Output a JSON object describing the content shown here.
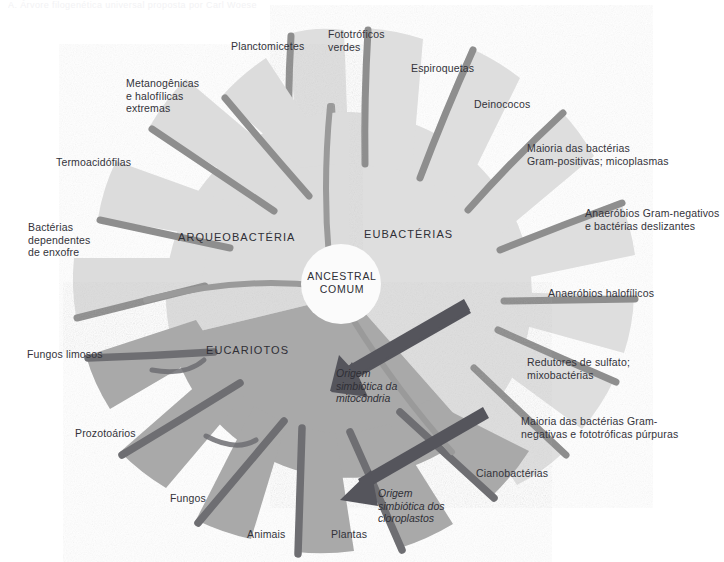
{
  "figure": {
    "top_caption": "A. Árvore filogenética universal proposta por Carl Woese",
    "domains": [
      {
        "id": "arqueobacteria",
        "label": "ARQUEOBACTÉRIA",
        "color": "#dcdcdc"
      },
      {
        "id": "eubacterias",
        "label": "EUBACTÉRIAS",
        "color": "#dedede"
      },
      {
        "id": "eucariotos",
        "label": "EUCARIOTOS",
        "color": "#a9a9a9"
      }
    ],
    "center": {
      "label": "ANCESTRAL\nCOMUM",
      "color": "#fbfbfb"
    },
    "colors": {
      "light_gray": "#dedede",
      "mid_gray": "#a9a9a9",
      "separator_gray": "#8e8e8e",
      "separator_dark": "#6e6e72",
      "arrow": "#55555c",
      "text": "#33333a",
      "background": "#ffffff"
    },
    "arrows": [
      {
        "id": "mitochondria",
        "label": "Origem\nsimbiótica da\nmitocôndria"
      },
      {
        "id": "chloroplasts",
        "label": "Origem\nsimbiótica dos\ncloroplastos"
      }
    ],
    "labels": {
      "metanogenicas": "Metanogênicas\ne halofílicas\nextremas",
      "termoacidofilas": "Termoacidófilas",
      "bacterias_enxofre": "Bactérias\ndependentes\nde enxofre",
      "planctomicetes": "Planctomicetes",
      "fototroficos_verdes": "Fototróficos\nverdes",
      "espiroquetas": "Espiroquetas",
      "deinococos": "Deinococos",
      "gram_positivas": "Maioria das bactérias\nGram-positivas; micoplasmas",
      "anaerobios_gramneg": "Anaeróbios Gram-negativos\ne bactérias deslizantes",
      "anaerobios_halo": "Anaeróbios halofílicos",
      "redutores_sulfato": "Redutores de sulfato;\nmixobactérias",
      "gram_neg_purpuras": "Maioria das bactérias Gram-\nnegativas e fototróficas púrpuras",
      "cianobacterias": "Cianobactérias",
      "fungos_limosos": "Fungos limosos",
      "prozotoarios": "Prozotoários",
      "fungos": "Fungos",
      "animais": "Animais",
      "plantas": "Plantas"
    }
  }
}
